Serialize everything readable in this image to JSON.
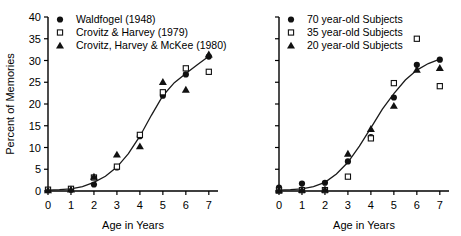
{
  "figure": {
    "panels": [
      "left",
      "right"
    ]
  },
  "chart_data": [
    {
      "panel": "left",
      "type": "scatter",
      "title": "",
      "xlabel": "Age in Years",
      "ylabel": "Percent of Memories",
      "xlim": [
        0,
        7.4
      ],
      "ylim": [
        0,
        40
      ],
      "xticks": [
        0,
        1,
        2,
        3,
        4,
        5,
        6,
        7
      ],
      "xticklabels": [
        "0",
        "1",
        "2",
        "3",
        "4",
        "5",
        "6",
        "7"
      ],
      "yticks": [
        0,
        5,
        10,
        15,
        20,
        25,
        30,
        35,
        40
      ],
      "yticklabels": [
        "0",
        "5",
        "10",
        "15",
        "20",
        "25",
        "30",
        "35",
        "40"
      ],
      "grid": false,
      "legend_position": "top-left",
      "series": [
        {
          "name": "Waldfogel (1948)",
          "marker": "filled-circle",
          "x": [
            0,
            1,
            2,
            3,
            4,
            5,
            6,
            7
          ],
          "values": [
            0.2,
            0.3,
            1.5,
            5.4,
            12.6,
            21.9,
            26.8,
            30.9
          ]
        },
        {
          "name": "Crovitz & Harvey (1979)",
          "marker": "open-square",
          "x": [
            0,
            1,
            2,
            3,
            4,
            5,
            6,
            7
          ],
          "values": [
            0.3,
            0.5,
            3.1,
            5.6,
            12.9,
            22.7,
            28.2,
            27.4
          ]
        },
        {
          "name": "Crovitz, Harvey & McKee (1980)",
          "marker": "filled-triangle",
          "x": [
            0,
            1,
            2,
            3,
            4,
            5,
            6,
            7
          ],
          "values": [
            0.2,
            0.4,
            3.3,
            8.4,
            10.3,
            25.1,
            23.3,
            31.4
          ]
        }
      ],
      "fit_curve": {
        "name": "sigmoid fit",
        "x": [
          0,
          0.5,
          1,
          1.5,
          2,
          2.5,
          3,
          3.5,
          4,
          4.5,
          5,
          5.5,
          6,
          6.5,
          7
        ],
        "values": [
          0.2,
          0.3,
          0.5,
          1.0,
          2.0,
          3.4,
          5.5,
          8.6,
          12.6,
          17.4,
          21.9,
          24.9,
          27.0,
          29.0,
          31.0
        ]
      }
    },
    {
      "panel": "right",
      "type": "scatter",
      "title": "",
      "xlabel": "Age in Years",
      "ylabel": "",
      "xlim": [
        0,
        7.4
      ],
      "ylim": [
        0,
        40
      ],
      "xticks": [
        0,
        1,
        2,
        3,
        4,
        5,
        6,
        7
      ],
      "xticklabels": [
        "0",
        "1",
        "2",
        "3",
        "4",
        "5",
        "6",
        "7"
      ],
      "yticks": [
        0,
        5,
        10,
        15,
        20,
        25,
        30,
        35,
        40
      ],
      "yticklabels": [
        "",
        "",
        "",
        "",
        "",
        "",
        "",
        "",
        ""
      ],
      "grid": false,
      "legend_position": "top-left",
      "series": [
        {
          "name": "70 year-old Subjects",
          "marker": "filled-circle",
          "x": [
            0,
            1,
            2,
            3,
            4,
            5,
            6,
            7
          ],
          "values": [
            0.8,
            1.7,
            1.9,
            6.8,
            12.4,
            21.5,
            29.0,
            30.2
          ]
        },
        {
          "name": "35 year-old Subjects",
          "marker": "open-square",
          "x": [
            0,
            1,
            2,
            3,
            4,
            5,
            6,
            7
          ],
          "values": [
            0.1,
            0.2,
            0.2,
            3.3,
            12.1,
            24.8,
            35.0,
            24.1
          ]
        },
        {
          "name": "20 year-old Subjects",
          "marker": "filled-triangle",
          "x": [
            0,
            1,
            2,
            3,
            4,
            5,
            6,
            7
          ],
          "values": [
            0.2,
            0.3,
            0.4,
            8.6,
            14.3,
            19.6,
            27.9,
            28.3
          ]
        }
      ],
      "fit_curve": {
        "name": "sigmoid fit",
        "x": [
          0,
          0.5,
          1,
          1.5,
          2,
          2.5,
          3,
          3.5,
          4,
          4.5,
          5,
          5.5,
          6,
          6.5,
          7
        ],
        "values": [
          0.2,
          0.3,
          0.5,
          1.0,
          2.0,
          3.9,
          6.6,
          10.3,
          14.5,
          18.8,
          22.4,
          25.5,
          27.8,
          29.3,
          30.3
        ]
      }
    }
  ],
  "left_panel": {
    "ylabel": "Percent of Memories",
    "xlabel": "Age in Years",
    "yticklabels": [
      "0",
      "5",
      "10",
      "15",
      "20",
      "25",
      "30",
      "35",
      "40"
    ],
    "xticklabels": [
      "0",
      "1",
      "2",
      "3",
      "4",
      "5",
      "6",
      "7"
    ],
    "legend": [
      {
        "label": "Waldfogel (1948)",
        "marker": "filled-circle"
      },
      {
        "label": "Crovitz & Harvey (1979)",
        "marker": "open-square"
      },
      {
        "label": "Crovitz, Harvey & McKee (1980)",
        "marker": "filled-triangle"
      }
    ]
  },
  "right_panel": {
    "ylabel": "",
    "xlabel": "Age in Years",
    "xticklabels": [
      "0",
      "1",
      "2",
      "3",
      "4",
      "5",
      "6",
      "7"
    ],
    "legend": [
      {
        "label": "70 year-old Subjects",
        "marker": "filled-circle"
      },
      {
        "label": "35 year-old Subjects",
        "marker": "open-square"
      },
      {
        "label": "20 year-old Subjects",
        "marker": "filled-triangle"
      }
    ]
  },
  "colors": {
    "ink": "#000000",
    "curve": "#1a1a1a",
    "marker_fill": "#111111",
    "marker_open": "#ffffff",
    "background": "#ffffff"
  }
}
